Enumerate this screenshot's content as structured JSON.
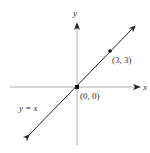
{
  "diagram": {
    "title": "",
    "axes": {
      "x_label": "x",
      "y_label": "y"
    },
    "line": {
      "equation_label": "y = x",
      "slope": 1,
      "intercept": 0
    },
    "points": [
      {
        "label": "(0, 0)",
        "x": 0,
        "y": 0
      },
      {
        "label": "(3, 3)",
        "x": 3,
        "y": 3
      }
    ],
    "colors": {
      "axis": "#999999",
      "line": "#222222",
      "text": "#333333"
    }
  }
}
